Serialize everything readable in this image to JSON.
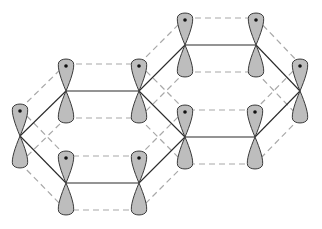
{
  "diagram": {
    "title": "",
    "colors": {
      "lobe_fill": "#bdbdbd",
      "lobe_stroke": "#3a3a3a",
      "sigma_bond": "#2a2a2a",
      "pi_overlap_dashed": "#a8a8a8",
      "electron_dot": "#111111"
    },
    "lobe": {
      "length": 32,
      "half_width": 8,
      "dot_offset": 25,
      "overlap_offset": 27
    },
    "atoms": [
      {
        "id": "A",
        "x": 20,
        "y": 136
      },
      {
        "id": "B",
        "x": 66,
        "y": 91
      },
      {
        "id": "C",
        "x": 139,
        "y": 91
      },
      {
        "id": "D",
        "x": 66,
        "y": 183
      },
      {
        "id": "E",
        "x": 139,
        "y": 183
      },
      {
        "id": "F",
        "x": 185,
        "y": 137
      },
      {
        "id": "G",
        "x": 185,
        "y": 45
      },
      {
        "id": "H",
        "x": 256,
        "y": 45
      },
      {
        "id": "I",
        "x": 300,
        "y": 91
      },
      {
        "id": "J",
        "x": 255,
        "y": 137
      }
    ],
    "bonds": [
      [
        "A",
        "B"
      ],
      [
        "B",
        "C"
      ],
      [
        "C",
        "F"
      ],
      [
        "F",
        "E"
      ],
      [
        "E",
        "D"
      ],
      [
        "D",
        "A"
      ],
      [
        "C",
        "G"
      ],
      [
        "G",
        "H"
      ],
      [
        "H",
        "I"
      ],
      [
        "I",
        "J"
      ],
      [
        "J",
        "F"
      ]
    ]
  }
}
